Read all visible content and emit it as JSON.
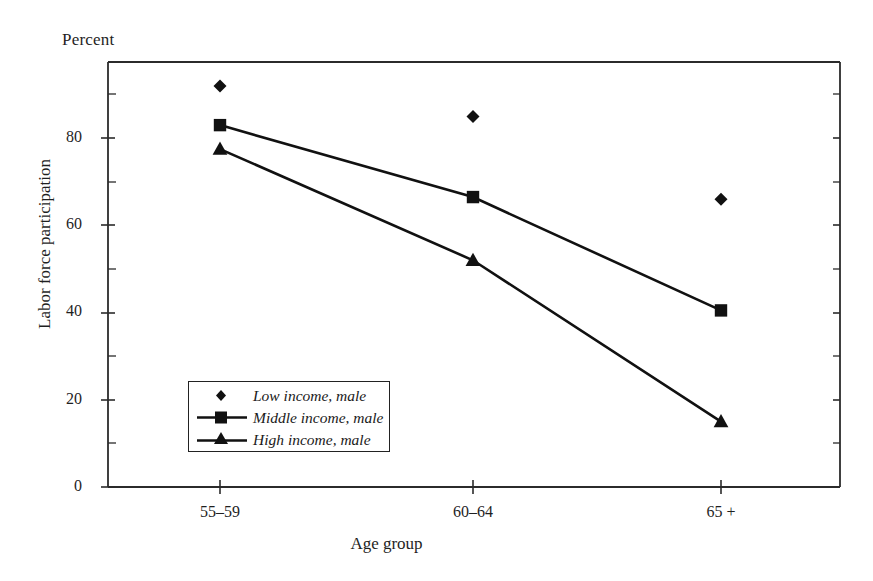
{
  "chart_data": {
    "type": "line",
    "title": "",
    "unit_label": "Percent",
    "xlabel": "Age group",
    "ylabel": "Labor force participation",
    "categories": [
      "55–59",
      "60–64",
      "65 +"
    ],
    "ylim": [
      0,
      100
    ],
    "yticks": [
      0,
      20,
      40,
      60,
      80
    ],
    "ytick_labels": [
      "0",
      "20",
      "40",
      "60",
      "80"
    ],
    "yminor_ticks": [
      10,
      30,
      50,
      70,
      90,
      100
    ],
    "grid": false,
    "legend_position": "inside-lower-left",
    "series": [
      {
        "name": "Low income, male",
        "marker": "diamond",
        "line": false,
        "values": [
          92,
          85,
          66
        ]
      },
      {
        "name": "Middle income, male",
        "marker": "square",
        "line": true,
        "values": [
          83,
          66.5,
          40.5
        ]
      },
      {
        "name": "High income, male",
        "marker": "triangle",
        "line": true,
        "values": [
          77.5,
          52,
          15
        ]
      }
    ],
    "colors": {
      "ink": "#111111",
      "axis": "#2b2b2b",
      "background": "#ffffff"
    }
  },
  "legend": {
    "items": [
      {
        "label": "Low income, male"
      },
      {
        "label": "Middle income, male"
      },
      {
        "label": "High income, male"
      }
    ]
  },
  "axes": {
    "y_tick_0": "0",
    "y_tick_20": "20",
    "y_tick_40": "40",
    "y_tick_60": "60",
    "y_tick_80": "80",
    "x_tick_0": "55–59",
    "x_tick_1": "60–64",
    "x_tick_2": "65 +"
  }
}
